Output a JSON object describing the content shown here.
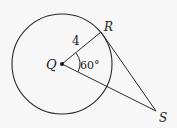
{
  "diagram": {
    "type": "geometry",
    "points": {
      "Q": {
        "label": "Q",
        "role": "center"
      },
      "R": {
        "label": "R",
        "role": "point on circle"
      },
      "S": {
        "label": "S",
        "role": "external point"
      }
    },
    "labels": {
      "radius": "4",
      "angle": "60°"
    },
    "colors": {
      "stroke": "#2a2a2a",
      "background": "#f7f7f7"
    }
  }
}
